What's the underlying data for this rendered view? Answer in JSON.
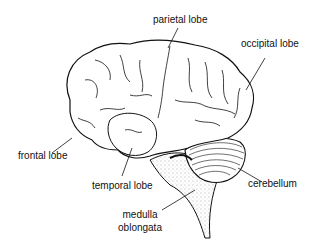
{
  "diagram": {
    "type": "labeled anatomical illustration",
    "labels": [
      {
        "id": "parietal",
        "text": "parietal lobe"
      },
      {
        "id": "occipital",
        "text": "occipital lobe"
      },
      {
        "id": "frontal",
        "text": "frontal lobe"
      },
      {
        "id": "temporal",
        "text": "temporal lobe"
      },
      {
        "id": "cerebellum",
        "text": "cerebellum"
      },
      {
        "id": "medulla_line1",
        "text": "medulla"
      },
      {
        "id": "medulla_line2",
        "text": "oblongata"
      }
    ],
    "colors": {
      "line": "#111111",
      "background": "#ffffff",
      "stipple": "#555555"
    }
  }
}
